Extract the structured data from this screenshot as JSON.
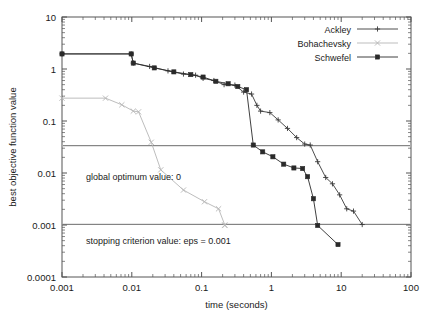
{
  "chart_data": {
    "type": "line",
    "title": "",
    "xlabel": "time (seconds)",
    "ylabel": "best objective function value",
    "xscale": "log",
    "yscale": "log",
    "xlim": [
      0.001,
      100
    ],
    "ylim": [
      0.0001,
      10
    ],
    "xticks": [
      "0.001",
      "0.01",
      "0.1",
      "1",
      "10",
      "100"
    ],
    "xtick_values": [
      0.001,
      0.01,
      0.1,
      1,
      10,
      100
    ],
    "yticks": [
      "0.0001",
      "0.001",
      "0.01",
      "0.1",
      "1",
      "10"
    ],
    "ytick_values": [
      0.0001,
      0.001,
      0.01,
      0.1,
      1,
      10
    ],
    "grid": false,
    "legend_position": "top-right",
    "series": [
      {
        "name": "Ackley",
        "marker": "plus",
        "color": "#3a3a3a",
        "points": [
          [
            0.001,
            1.95
          ],
          [
            0.0098,
            1.95
          ],
          [
            0.0105,
            1.3
          ],
          [
            0.018,
            1.12
          ],
          [
            0.033,
            0.92
          ],
          [
            0.055,
            0.8
          ],
          [
            0.082,
            0.76
          ],
          [
            0.105,
            0.66
          ],
          [
            0.15,
            0.6
          ],
          [
            0.21,
            0.5
          ],
          [
            0.3,
            0.49
          ],
          [
            0.4,
            0.36
          ],
          [
            0.52,
            0.33
          ],
          [
            0.62,
            0.2
          ],
          [
            0.7,
            0.155
          ],
          [
            0.95,
            0.145
          ],
          [
            1.25,
            0.105
          ],
          [
            1.7,
            0.072
          ],
          [
            2.3,
            0.048
          ],
          [
            3.0,
            0.036
          ],
          [
            3.6,
            0.0345
          ],
          [
            4.6,
            0.0165
          ],
          [
            6.0,
            0.0082
          ],
          [
            7.5,
            0.0062
          ],
          [
            9.5,
            0.0038
          ],
          [
            12.0,
            0.00205
          ],
          [
            15.0,
            0.00185
          ],
          [
            20.0,
            0.00102
          ]
        ]
      },
      {
        "name": "Bohachevsky",
        "marker": "cross",
        "color": "#b6b6b6",
        "points": [
          [
            0.001,
            0.275
          ],
          [
            0.0042,
            0.275
          ],
          [
            0.0072,
            0.205
          ],
          [
            0.0105,
            0.155
          ],
          [
            0.0125,
            0.15
          ],
          [
            0.019,
            0.039
          ],
          [
            0.026,
            0.0115
          ],
          [
            0.055,
            0.0047
          ],
          [
            0.11,
            0.0028
          ],
          [
            0.175,
            0.00205
          ],
          [
            0.215,
            0.001
          ],
          [
            0.215,
            0.00098
          ]
        ]
      },
      {
        "name": "Schwefel",
        "marker": "square",
        "color": "#2a2a2a",
        "points": [
          [
            0.001,
            1.95
          ],
          [
            0.0098,
            1.95
          ],
          [
            0.0105,
            1.3
          ],
          [
            0.021,
            1.05
          ],
          [
            0.04,
            0.88
          ],
          [
            0.07,
            0.78
          ],
          [
            0.105,
            0.7
          ],
          [
            0.16,
            0.58
          ],
          [
            0.24,
            0.52
          ],
          [
            0.33,
            0.46
          ],
          [
            0.44,
            0.4
          ],
          [
            0.55,
            0.0345
          ],
          [
            0.75,
            0.0255
          ],
          [
            1.05,
            0.0205
          ],
          [
            1.5,
            0.0148
          ],
          [
            2.1,
            0.0125
          ],
          [
            2.8,
            0.0122
          ],
          [
            3.3,
            0.0085
          ],
          [
            4.0,
            0.0032
          ],
          [
            4.6,
            0.00098
          ],
          [
            9.0,
            0.00042
          ]
        ]
      }
    ],
    "reference_lines": [
      {
        "name": "global-optimum-line",
        "y": 0.0335,
        "color": "#6a6a6a"
      },
      {
        "name": "stopping-criterion-line",
        "y": 0.00103,
        "color": "#6a6a6a"
      }
    ],
    "annotations": [
      {
        "name": "global-optimum-annotation",
        "text": "global optimum value: 0",
        "x": 0.0022,
        "y": 0.0072
      },
      {
        "name": "stopping-criterion-annotation",
        "text": "stopping criterion value: eps = 0.001",
        "x": 0.0022,
        "y": 0.00043
      }
    ]
  }
}
